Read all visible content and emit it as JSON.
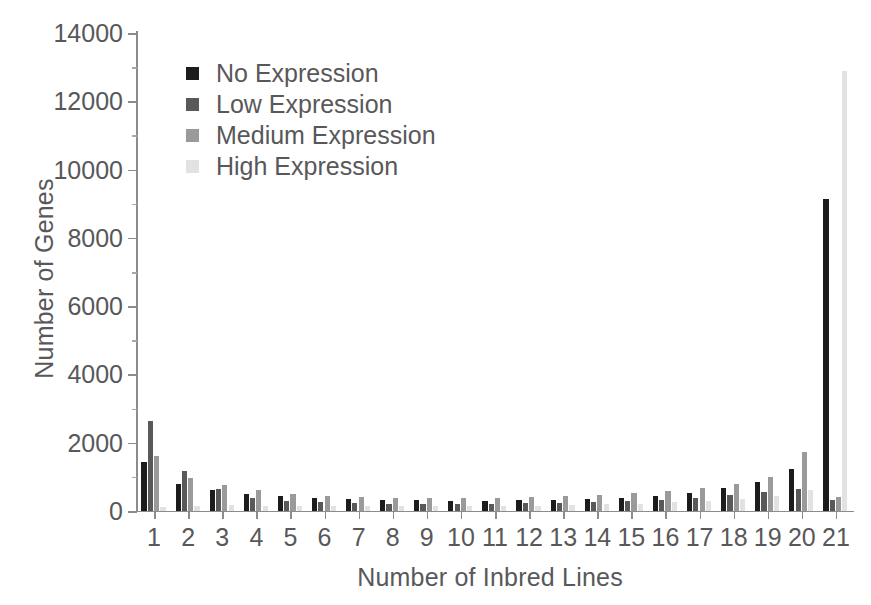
{
  "chart_data": {
    "type": "bar",
    "title": "",
    "xlabel": "Number of Inbred Lines",
    "ylabel": "Number of Genes",
    "categories": [
      "1",
      "2",
      "3",
      "4",
      "5",
      "6",
      "7",
      "8",
      "9",
      "10",
      "11",
      "12",
      "13",
      "14",
      "15",
      "16",
      "17",
      "18",
      "19",
      "20",
      "21"
    ],
    "ylim": [
      0,
      14000
    ],
    "yticks": [
      0,
      2000,
      4000,
      6000,
      8000,
      10000,
      12000,
      14000
    ],
    "ytick_labels": [
      "0",
      "2000",
      "4000",
      "6000",
      "8000",
      "10000",
      "12000",
      "14000"
    ],
    "grid": false,
    "legend_position": "upper-left-inside",
    "series": [
      {
        "name": "No Expression",
        "color": "#1c1c1c",
        "values": [
          1450,
          780,
          620,
          500,
          430,
          370,
          340,
          320,
          310,
          300,
          300,
          310,
          330,
          350,
          390,
          450,
          530,
          660,
          850,
          1230,
          9150
        ]
      },
      {
        "name": "Low Expression",
        "color": "#595959",
        "values": [
          2650,
          1180,
          650,
          380,
          290,
          250,
          230,
          220,
          215,
          210,
          215,
          225,
          240,
          260,
          290,
          330,
          390,
          470,
          560,
          640,
          330
        ]
      },
      {
        "name": "Medium Expression",
        "color": "#9a9a9a",
        "values": [
          1600,
          980,
          760,
          610,
          500,
          440,
          400,
          380,
          370,
          370,
          380,
          400,
          430,
          470,
          520,
          590,
          680,
          800,
          1000,
          1740,
          400
        ]
      },
      {
        "name": "High Expression",
        "color": "#e2e2e2",
        "values": [
          110,
          150,
          170,
          160,
          150,
          145,
          140,
          140,
          140,
          145,
          150,
          160,
          175,
          195,
          220,
          250,
          290,
          350,
          440,
          620,
          12900
        ]
      }
    ]
  }
}
